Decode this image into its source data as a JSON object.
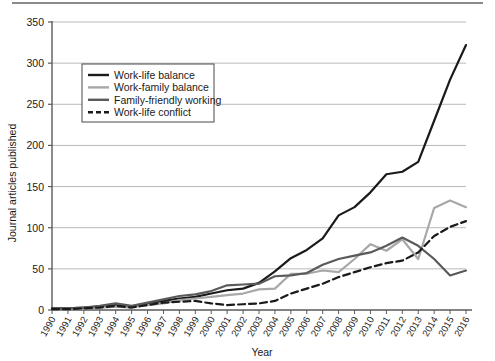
{
  "chart_data": {
    "type": "line",
    "title": "",
    "xlabel": "Year",
    "ylabel": "Journal articles published",
    "x": [
      1990,
      1991,
      1992,
      1993,
      1994,
      1995,
      1996,
      1997,
      1998,
      1999,
      2000,
      2001,
      2002,
      2003,
      2004,
      2005,
      2006,
      2007,
      2008,
      2009,
      2010,
      2011,
      2012,
      2013,
      2014,
      2015,
      2016
    ],
    "xlim": [
      1990,
      2016
    ],
    "ylim": [
      0,
      350
    ],
    "yticks": [
      0,
      50,
      100,
      150,
      200,
      250,
      300,
      350
    ],
    "xticks": [
      "1990",
      "1991",
      "1992",
      "1993",
      "1994",
      "1995",
      "1996",
      "1997",
      "1998",
      "1999",
      "2000",
      "2001",
      "2002",
      "2003",
      "2004",
      "2005",
      "2006",
      "2007",
      "2008",
      "2009",
      "2010",
      "2011",
      "2012",
      "2013",
      "2014",
      "2015",
      "2016"
    ],
    "grid": "horizontal",
    "legend_position": "upper-left-inside",
    "series": [
      {
        "name": "Work-life balance",
        "color": "#1a1a1a",
        "style": "solid",
        "width": 2.2,
        "values": [
          2,
          2,
          3,
          4,
          6,
          4,
          8,
          11,
          14,
          16,
          20,
          24,
          26,
          33,
          47,
          63,
          73,
          87,
          115,
          125,
          143,
          165,
          168,
          180,
          230,
          280,
          322
        ]
      },
      {
        "name": "Work-family balance",
        "color": "#a8a8a8",
        "style": "solid",
        "width": 2.2,
        "values": [
          1,
          1,
          2,
          3,
          4,
          3,
          6,
          8,
          12,
          14,
          16,
          18,
          20,
          25,
          26,
          44,
          44,
          48,
          46,
          62,
          80,
          72,
          86,
          62,
          124,
          133,
          125
        ]
      },
      {
        "name": "Family-friendly working",
        "color": "#5a5a5a",
        "style": "solid",
        "width": 2.2,
        "values": [
          1,
          2,
          3,
          5,
          8,
          5,
          9,
          13,
          17,
          19,
          23,
          30,
          31,
          32,
          41,
          42,
          45,
          55,
          62,
          66,
          70,
          78,
          88,
          78,
          62,
          42,
          48
        ]
      },
      {
        "name": "Work-life conflict",
        "color": "#1a1a1a",
        "style": "dashed",
        "width": 2.2,
        "values": [
          1,
          1,
          2,
          3,
          5,
          3,
          6,
          9,
          10,
          11,
          8,
          6,
          7,
          8,
          11,
          20,
          26,
          32,
          40,
          46,
          52,
          57,
          60,
          70,
          90,
          101,
          108
        ]
      }
    ]
  },
  "axes": {
    "y_title": "Journal articles published",
    "x_title": "Year"
  },
  "legend": {
    "items": [
      {
        "label": "Work-life balance"
      },
      {
        "label": "Work-family balance"
      },
      {
        "label": "Family-friendly working"
      },
      {
        "label": "Work-life conflict"
      }
    ]
  }
}
